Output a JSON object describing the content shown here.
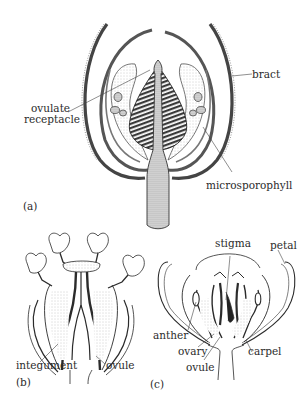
{
  "figure": {
    "panels": [
      {
        "id": "a",
        "panel_label": "(a)",
        "labels": {
          "bract": "bract",
          "ovulate_receptacle_line1": "ovulate",
          "ovulate_receptacle_line2": "receptacle",
          "microsporophyll": "microsporophyll"
        }
      },
      {
        "id": "b",
        "panel_label": "(b)",
        "labels": {
          "integument": "integument",
          "ovule": "ovule"
        }
      },
      {
        "id": "c",
        "panel_label": "(c)",
        "labels": {
          "stigma": "stigma",
          "petal": "petal",
          "anther": "anther",
          "ovary": "ovary",
          "ovule": "ovule",
          "carpel": "carpel"
        }
      }
    ],
    "colors": {
      "ink": "#2b2b2b",
      "stipple": "#c8c8c8",
      "background": "#ffffff"
    }
  }
}
